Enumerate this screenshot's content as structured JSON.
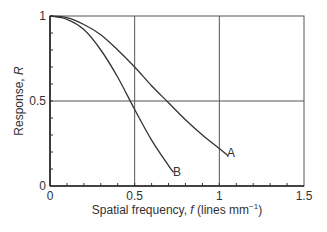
{
  "chart_data": {
    "type": "line",
    "title": "",
    "xlabel": "Spatial frequency, f (lines mm⁻¹)",
    "ylabel": "Response, R",
    "xlim": [
      0,
      1.5
    ],
    "ylim": [
      0,
      1
    ],
    "x_ticks": [
      "0",
      "0.5",
      "1",
      "1.5"
    ],
    "y_ticks": [
      "0",
      "0.5",
      "1"
    ],
    "grid": true,
    "series": [
      {
        "name": "A",
        "x": [
          0,
          0.1,
          0.2,
          0.3,
          0.4,
          0.5,
          0.6,
          0.7,
          0.8,
          0.9,
          1.0,
          1.05
        ],
        "y": [
          1.0,
          0.99,
          0.95,
          0.89,
          0.8,
          0.7,
          0.59,
          0.49,
          0.39,
          0.3,
          0.22,
          0.18
        ]
      },
      {
        "name": "B",
        "x": [
          0,
          0.1,
          0.2,
          0.3,
          0.4,
          0.5,
          0.6,
          0.7,
          0.73
        ],
        "y": [
          1.0,
          0.98,
          0.92,
          0.8,
          0.64,
          0.45,
          0.27,
          0.12,
          0.08
        ]
      }
    ]
  },
  "axes": {
    "x_title_prefix": "Spatial frequency, ",
    "x_title_var": "f",
    "x_title_units": " (lines mm",
    "x_title_exp": "−1",
    "x_title_close": ")",
    "y_title_prefix": "Response, ",
    "y_title_var": "R"
  },
  "labels": {
    "a": "A",
    "b": "B"
  }
}
